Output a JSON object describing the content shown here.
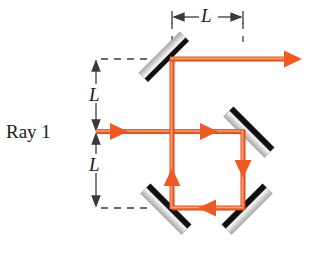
{
  "figure": {
    "kind": "optics-ray-diagram",
    "width": 311,
    "height": 255,
    "background_color": "#ffffff"
  },
  "labels": {
    "ray_label": "Ray 1",
    "dim_top": "L",
    "dim_upper": "L",
    "dim_lower": "L"
  },
  "colors": {
    "ray": "#ED5A24",
    "ray_core": "#F58A5A",
    "mirror_light": "#F2F2F2",
    "mirror_mid": "#BFBFBF",
    "mirror_dark": "#111111",
    "dimension_line": "#3A3A3A",
    "dashed_line": "#3A3A3A",
    "text": "#1A1A1A"
  },
  "geometry": {
    "ray_axis_y": 132,
    "top_ray_y": 59,
    "bottom_ray_y": 208,
    "left_vertical_x": 172,
    "right_vertical_x": 243,
    "ray_entry_x": 96,
    "ray_exit_x": 302,
    "dimension_vertical_x": 96,
    "dimension_top_y": 17
  },
  "mirrors": [
    {
      "name": "mirror-top-left",
      "center_x": 165,
      "center_y": 58,
      "angle_deg": -45,
      "length": 56,
      "reflective_side": "lower-left"
    },
    {
      "name": "mirror-middle-right",
      "center_x": 249,
      "center_y": 132,
      "angle_deg": 45,
      "length": 56,
      "reflective_side": "upper-left"
    },
    {
      "name": "mirror-bottom-left",
      "center_x": 166,
      "center_y": 209,
      "angle_deg": 45,
      "length": 56,
      "reflective_side": "upper-left"
    },
    {
      "name": "mirror-bottom-right",
      "center_x": 247,
      "center_y": 209,
      "angle_deg": -45,
      "length": 56,
      "reflective_side": "upper-right"
    }
  ],
  "ray_segments": [
    {
      "name": "ray-incoming",
      "from": [
        96,
        132
      ],
      "to": [
        243,
        132
      ],
      "direction": "right"
    },
    {
      "name": "ray-left-vertical-up",
      "from": [
        172,
        208
      ],
      "to": [
        172,
        59
      ],
      "direction": "up"
    },
    {
      "name": "ray-top-outgoing",
      "from": [
        172,
        59
      ],
      "to": [
        302,
        59
      ],
      "direction": "right"
    },
    {
      "name": "ray-right-vertical-down",
      "from": [
        243,
        132
      ],
      "to": [
        243,
        208
      ],
      "direction": "down"
    },
    {
      "name": "ray-bottom-leftward",
      "from": [
        243,
        208
      ],
      "to": [
        172,
        208
      ],
      "direction": "left"
    }
  ],
  "arrowheads": [
    {
      "name": "arrow-incoming-1",
      "x": 118,
      "y": 132,
      "direction": "right"
    },
    {
      "name": "arrow-incoming-2",
      "x": 208,
      "y": 132,
      "direction": "right"
    },
    {
      "name": "arrow-top-exit",
      "x": 300,
      "y": 59,
      "direction": "right"
    },
    {
      "name": "arrow-left-up",
      "x": 172,
      "y": 176,
      "direction": "up"
    },
    {
      "name": "arrow-right-down",
      "x": 243,
      "y": 166,
      "direction": "down"
    },
    {
      "name": "arrow-bottom-left",
      "x": 207,
      "y": 208,
      "direction": "left"
    }
  ],
  "dimension_lines": [
    {
      "name": "dimension-top-horizontal",
      "orientation": "horizontal",
      "from": [
        172,
        17
      ],
      "to": [
        243,
        17
      ],
      "label": "L"
    },
    {
      "name": "dimension-upper-vertical",
      "orientation": "vertical",
      "from": [
        96,
        59
      ],
      "to": [
        96,
        132
      ],
      "label": "L"
    },
    {
      "name": "dimension-lower-vertical",
      "orientation": "vertical",
      "from": [
        96,
        132
      ],
      "to": [
        96,
        208
      ],
      "label": "L"
    }
  ],
  "dashed_guides": [
    {
      "name": "dashed-guide-top",
      "from": [
        100,
        59
      ],
      "to": [
        152,
        59
      ]
    },
    {
      "name": "dashed-guide-bottom",
      "from": [
        100,
        208
      ],
      "to": [
        152,
        208
      ]
    },
    {
      "name": "dashed-tick-left",
      "from": [
        172,
        22
      ],
      "to": [
        172,
        42
      ]
    },
    {
      "name": "dashed-tick-right",
      "from": [
        243,
        22
      ],
      "to": [
        243,
        46
      ]
    }
  ]
}
